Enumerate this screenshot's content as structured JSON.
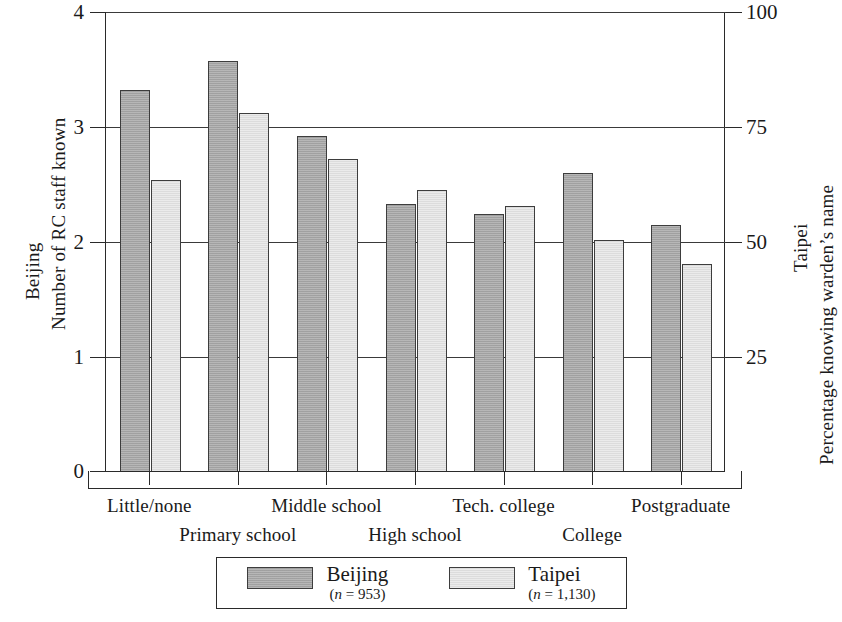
{
  "chart_data": {
    "type": "bar",
    "title": "",
    "categories": [
      "Little/none",
      "Primary school",
      "Middle school",
      "High school",
      "Tech. college",
      "College",
      "Postgraduate"
    ],
    "series": [
      {
        "name": "Beijing",
        "n_label": "(n = 953)",
        "color": "#a9a9a9",
        "values": [
          3.32,
          3.57,
          2.92,
          2.33,
          2.24,
          2.6,
          2.15
        ]
      },
      {
        "name": "Taipei",
        "n_label": "(n = 1,130)",
        "color": "#e3e3e3",
        "values": [
          2.54,
          3.12,
          2.72,
          2.45,
          2.31,
          2.02,
          1.81
        ]
      }
    ],
    "left_axis": {
      "title_line1": "Beijing",
      "title_line2": "Number of RC staff known",
      "ticks": [
        0,
        1,
        2,
        3,
        4
      ],
      "ylim": [
        0,
        4
      ]
    },
    "right_axis": {
      "title_line1": "Taipei",
      "title_line2": "Percentage knowing warden's name",
      "ticks": [
        25,
        50,
        75,
        100
      ],
      "ylim": [
        0,
        100
      ]
    },
    "xlabel": "",
    "grid": true,
    "legend_position": "bottom"
  },
  "axes": {
    "left": {
      "title_outer": "Beijing",
      "title_inner": "Number of RC staff known",
      "tick_0": "0",
      "tick_1": "1",
      "tick_2": "2",
      "tick_3": "3",
      "tick_4": "4"
    },
    "right": {
      "title_outer": "Taipei",
      "title_inner": "Percentage knowing warden’s name",
      "tick_25": "25",
      "tick_50": "50",
      "tick_75": "75",
      "tick_100": "100"
    }
  },
  "categories": {
    "c0": "Little/none",
    "c1": "Primary school",
    "c2": "Middle school",
    "c3": "High school",
    "c4": "Tech. college",
    "c5": "College",
    "c6": "Postgraduate"
  },
  "legend": {
    "beijing_name": "Beijing",
    "beijing_n": "(n = 953)",
    "beijing_n_italic": "n",
    "beijing_n_rest": " = 953)",
    "taipei_name": "Taipei",
    "taipei_n": "(n = 1,130)",
    "taipei_n_italic": "n",
    "taipei_n_rest": " = 1,130)"
  }
}
